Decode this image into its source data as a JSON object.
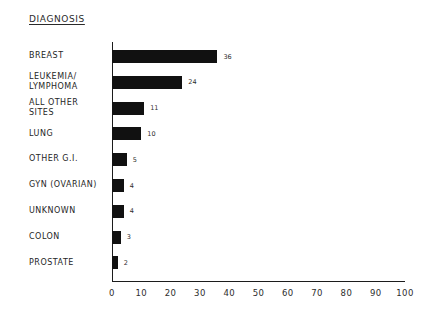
{
  "chart_data": {
    "type": "bar",
    "orientation": "horizontal",
    "title": "DIAGNOSIS",
    "xlabel": "",
    "ylabel": "",
    "xlim": [
      0,
      100
    ],
    "xticks": [
      "0",
      "10",
      "20",
      "30",
      "40",
      "50",
      "60",
      "70",
      "80",
      "90",
      "100"
    ],
    "grid": false,
    "legend": null,
    "bar_color": "#111111",
    "axis_color": "#1c1c1c",
    "categories": [
      "BREAST",
      "LEUKEMIA/\nLYMPHOMA",
      "ALL OTHER\nSITES",
      "LUNG",
      "OTHER G.I.",
      "GYN (OVARIAN)",
      "UNKNOWN",
      "COLON",
      "PROSTATE"
    ],
    "values": [
      36,
      24,
      11,
      10,
      5,
      4,
      4,
      3,
      2
    ],
    "value_labels": [
      "36",
      "24",
      "11",
      "10",
      "5",
      "4",
      "4",
      "3",
      "2"
    ]
  }
}
